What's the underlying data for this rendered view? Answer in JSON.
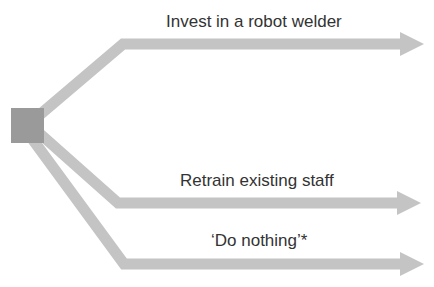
{
  "diagram": {
    "type": "decision-tree",
    "colors": {
      "decision_node": "#9a9a9a",
      "branch": "#c4c4c4",
      "text": "#333333"
    },
    "decision_node": {
      "shape": "square",
      "label": ""
    },
    "branches": [
      {
        "label": "Invest in a robot welder"
      },
      {
        "label": "Retrain existing staff"
      },
      {
        "label": "‘Do nothing’*"
      }
    ]
  }
}
